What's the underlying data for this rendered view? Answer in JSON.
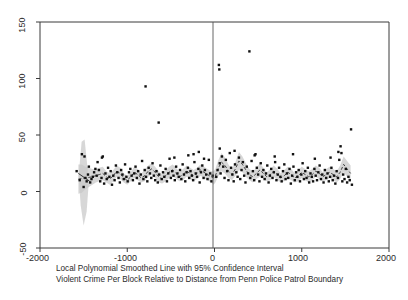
{
  "chart_data": {
    "type": "scatter",
    "title": "",
    "caption_line1": "Local Polynomial Smoothed Line with 95% Confidence Interval",
    "caption_line2": "Violent Crime Per Block Relative to Distance from Penn Police Patrol Boundary",
    "xlabel": "",
    "ylabel": "",
    "xlim": [
      -2000,
      2000
    ],
    "ylim": [
      -50,
      150
    ],
    "xticks": [
      -2000,
      -1000,
      0,
      1000,
      2000
    ],
    "xtick_labels": [
      "-2000",
      "-1000",
      "0",
      "1000",
      "2000"
    ],
    "yticks": [
      -50,
      0,
      50,
      100,
      150
    ],
    "ytick_labels": [
      "-50",
      "0",
      "50",
      "100",
      "150"
    ],
    "grid": false,
    "legend": "none",
    "vline": {
      "x": 0,
      "label": "patrol-boundary",
      "color": "#555555"
    },
    "marker": {
      "shape": "square",
      "size": 2.4,
      "color": "#111111"
    },
    "band": {
      "color": "#c8c8c8",
      "opacity": 0.72,
      "label": "95% Confidence Interval"
    },
    "line": {
      "color": "#333333",
      "width": 0.9,
      "style": "dashed",
      "label": "Local polynomial smoothed line"
    },
    "series": [
      {
        "name": "Violent crime per block",
        "points": [
          [
            -1580,
            18
          ],
          [
            -1545,
            10
          ],
          [
            -1520,
            33
          ],
          [
            -1500,
            4
          ],
          [
            -1480,
            12
          ],
          [
            -1465,
            9
          ],
          [
            -1450,
            15
          ],
          [
            -1440,
            22
          ],
          [
            -1425,
            8
          ],
          [
            -1410,
            11
          ],
          [
            -1395,
            13
          ],
          [
            -1380,
            17
          ],
          [
            -1365,
            20
          ],
          [
            -1350,
            14
          ],
          [
            -1340,
            26
          ],
          [
            -1325,
            19
          ],
          [
            -1310,
            9
          ],
          [
            -1295,
            12
          ],
          [
            -1280,
            31
          ],
          [
            -1265,
            7
          ],
          [
            -1250,
            16
          ],
          [
            -1235,
            11
          ],
          [
            -1220,
            21
          ],
          [
            -1205,
            13
          ],
          [
            -1190,
            18
          ],
          [
            -1175,
            6
          ],
          [
            -1160,
            14
          ],
          [
            -1145,
            10
          ],
          [
            -1130,
            23
          ],
          [
            -1115,
            17
          ],
          [
            -1100,
            12
          ],
          [
            -1085,
            8
          ],
          [
            -1070,
            19
          ],
          [
            -1055,
            15
          ],
          [
            -1040,
            11
          ],
          [
            -1025,
            24
          ],
          [
            -1010,
            13
          ],
          [
            -995,
            9
          ],
          [
            -980,
            17
          ],
          [
            -965,
            20
          ],
          [
            -950,
            14
          ],
          [
            -935,
            10
          ],
          [
            -920,
            16
          ],
          [
            -905,
            22
          ],
          [
            -890,
            12
          ],
          [
            -875,
            18
          ],
          [
            -860,
            7
          ],
          [
            -845,
            15
          ],
          [
            -830,
            27
          ],
          [
            -815,
            11
          ],
          [
            -800,
            19
          ],
          [
            -790,
            93
          ],
          [
            -785,
            13
          ],
          [
            -770,
            9
          ],
          [
            -755,
            21
          ],
          [
            -740,
            16
          ],
          [
            -725,
            12
          ],
          [
            -710,
            25
          ],
          [
            -695,
            14
          ],
          [
            -680,
            10
          ],
          [
            -665,
            18
          ],
          [
            -650,
            8
          ],
          [
            -640,
            61
          ],
          [
            -635,
            15
          ],
          [
            -620,
            23
          ],
          [
            -605,
            11
          ],
          [
            -590,
            17
          ],
          [
            -575,
            13
          ],
          [
            -560,
            20
          ],
          [
            -545,
            9
          ],
          [
            -530,
            16
          ],
          [
            -515,
            29
          ],
          [
            -500,
            12
          ],
          [
            -485,
            18
          ],
          [
            -470,
            14
          ],
          [
            -455,
            10
          ],
          [
            -440,
            22
          ],
          [
            -425,
            16
          ],
          [
            -410,
            13
          ],
          [
            -395,
            19
          ],
          [
            -380,
            11
          ],
          [
            -365,
            24
          ],
          [
            -350,
            15
          ],
          [
            -335,
            9
          ],
          [
            -320,
            17
          ],
          [
            -305,
            21
          ],
          [
            -290,
            12
          ],
          [
            -275,
            18
          ],
          [
            -260,
            14
          ],
          [
            -245,
            10
          ],
          [
            -230,
            26
          ],
          [
            -215,
            16
          ],
          [
            -200,
            13
          ],
          [
            -185,
            20
          ],
          [
            -170,
            8
          ],
          [
            -155,
            17
          ],
          [
            -140,
            23
          ],
          [
            -125,
            12
          ],
          [
            -110,
            19
          ],
          [
            -95,
            15
          ],
          [
            -80,
            11
          ],
          [
            -65,
            28
          ],
          [
            -50,
            16
          ],
          [
            -35,
            9
          ],
          [
            -20,
            14
          ],
          [
            -240,
            33
          ],
          [
            -180,
            35
          ],
          [
            -1490,
            31
          ],
          [
            -1290,
            30
          ],
          [
            -460,
            30
          ],
          [
            -300,
            32
          ],
          [
            -120,
            29
          ],
          [
            20,
            13
          ],
          [
            35,
            19
          ],
          [
            50,
            112
          ],
          [
            55,
            108
          ],
          [
            60,
            25
          ],
          [
            70,
            16
          ],
          [
            85,
            31
          ],
          [
            100,
            22
          ],
          [
            115,
            12
          ],
          [
            130,
            28
          ],
          [
            145,
            18
          ],
          [
            160,
            10
          ],
          [
            175,
            34
          ],
          [
            190,
            21
          ],
          [
            205,
            15
          ],
          [
            220,
            9
          ],
          [
            235,
            24
          ],
          [
            250,
            17
          ],
          [
            265,
            13
          ],
          [
            280,
            30
          ],
          [
            295,
            11
          ],
          [
            310,
            19
          ],
          [
            325,
            26
          ],
          [
            340,
            14
          ],
          [
            355,
            8
          ],
          [
            370,
            22
          ],
          [
            385,
            16
          ],
          [
            400,
            124
          ],
          [
            410,
            12
          ],
          [
            425,
            27
          ],
          [
            440,
            18
          ],
          [
            455,
            10
          ],
          [
            470,
            33
          ],
          [
            485,
            21
          ],
          [
            500,
            15
          ],
          [
            515,
            9
          ],
          [
            530,
            25
          ],
          [
            545,
            13
          ],
          [
            560,
            19
          ],
          [
            575,
            11
          ],
          [
            590,
            16
          ],
          [
            605,
            23
          ],
          [
            620,
            8
          ],
          [
            635,
            14
          ],
          [
            650,
            20
          ],
          [
            665,
            12
          ],
          [
            680,
            17
          ],
          [
            695,
            26
          ],
          [
            710,
            10
          ],
          [
            725,
            15
          ],
          [
            740,
            21
          ],
          [
            755,
            13
          ],
          [
            770,
            9
          ],
          [
            785,
            18
          ],
          [
            800,
            24
          ],
          [
            815,
            11
          ],
          [
            830,
            16
          ],
          [
            845,
            12
          ],
          [
            860,
            20
          ],
          [
            875,
            7
          ],
          [
            890,
            14
          ],
          [
            905,
            22
          ],
          [
            920,
            10
          ],
          [
            935,
            17
          ],
          [
            950,
            13
          ],
          [
            965,
            19
          ],
          [
            980,
            9
          ],
          [
            995,
            15
          ],
          [
            1010,
            25
          ],
          [
            1025,
            11
          ],
          [
            1040,
            18
          ],
          [
            1055,
            12
          ],
          [
            1070,
            21
          ],
          [
            1085,
            8
          ],
          [
            1100,
            16
          ],
          [
            1115,
            13
          ],
          [
            1130,
            9
          ],
          [
            1145,
            20
          ],
          [
            1160,
            14
          ],
          [
            1175,
            10
          ],
          [
            1190,
            17
          ],
          [
            1205,
            23
          ],
          [
            1220,
            11
          ],
          [
            1235,
            15
          ],
          [
            1250,
            8
          ],
          [
            1265,
            19
          ],
          [
            1280,
            12
          ],
          [
            1295,
            16
          ],
          [
            1310,
            9
          ],
          [
            1325,
            13
          ],
          [
            1340,
            21
          ],
          [
            1355,
            10
          ],
          [
            1370,
            14
          ],
          [
            1385,
            7
          ],
          [
            1400,
            18
          ],
          [
            1415,
            12
          ],
          [
            1430,
            28
          ],
          [
            1445,
            40
          ],
          [
            1455,
            34
          ],
          [
            1465,
            9
          ],
          [
            1475,
            15
          ],
          [
            1490,
            11
          ],
          [
            1505,
            20
          ],
          [
            1520,
            8
          ],
          [
            1535,
            13
          ],
          [
            1550,
            10
          ],
          [
            1565,
            55
          ],
          [
            1575,
            6
          ],
          [
            60,
            38
          ],
          [
            230,
            36
          ],
          [
            460,
            32
          ],
          [
            690,
            31
          ],
          [
            900,
            33
          ],
          [
            1150,
            29
          ],
          [
            1330,
            30
          ],
          [
            1420,
            35
          ]
        ]
      }
    ],
    "smooth_line": {
      "x": [
        -1560,
        -1520,
        -1480,
        -1440,
        -1400,
        -1360,
        -1320,
        -1280,
        -1240,
        -1200,
        -1160,
        -1120,
        -1080,
        -1040,
        -1000,
        -960,
        -920,
        -880,
        -840,
        -800,
        -760,
        -720,
        -680,
        -640,
        -600,
        -560,
        -520,
        -480,
        -440,
        -400,
        -360,
        -320,
        -280,
        -240,
        -200,
        -160,
        -120,
        -80,
        -40,
        -10,
        10,
        40,
        80,
        120,
        160,
        200,
        240,
        280,
        320,
        360,
        400,
        440,
        480,
        520,
        560,
        600,
        640,
        680,
        720,
        760,
        800,
        840,
        880,
        920,
        960,
        1000,
        1040,
        1080,
        1120,
        1160,
        1200,
        1240,
        1280,
        1320,
        1360,
        1400,
        1440,
        1480,
        1520,
        1560
      ],
      "y": [
        11,
        11.5,
        12,
        12.5,
        13,
        14,
        15,
        16,
        13,
        11,
        14,
        18,
        16,
        12,
        10,
        13,
        17,
        15,
        12,
        14,
        18,
        20,
        17,
        13,
        11,
        14,
        17,
        19,
        16,
        13,
        15,
        18,
        16,
        14,
        16,
        19,
        17,
        15,
        13,
        12,
        14,
        20,
        26,
        23,
        18,
        15,
        20,
        27,
        24,
        19,
        15,
        13,
        16,
        19,
        16,
        13,
        15,
        18,
        15,
        12,
        14,
        17,
        15,
        12,
        14,
        17,
        15,
        13,
        15,
        18,
        16,
        13,
        15,
        17,
        15,
        13,
        17,
        24,
        20,
        16
      ],
      "lower": [
        -2,
        -1,
        2,
        4,
        6,
        8,
        9,
        10,
        8,
        6,
        9,
        13,
        11,
        8,
        6,
        9,
        12,
        10,
        8,
        9,
        13,
        15,
        12,
        8,
        7,
        9,
        12,
        14,
        11,
        9,
        10,
        13,
        11,
        9,
        11,
        14,
        12,
        10,
        8,
        6,
        8,
        13,
        18,
        16,
        12,
        10,
        14,
        19,
        17,
        13,
        10,
        8,
        11,
        13,
        11,
        9,
        10,
        13,
        10,
        8,
        9,
        12,
        10,
        8,
        9,
        12,
        10,
        8,
        10,
        13,
        11,
        9,
        10,
        12,
        10,
        8,
        11,
        17,
        13,
        9
      ],
      "upper": [
        24,
        24,
        22,
        21,
        20,
        20,
        21,
        22,
        18,
        16,
        19,
        23,
        21,
        16,
        14,
        17,
        22,
        20,
        16,
        19,
        23,
        25,
        22,
        18,
        15,
        19,
        22,
        24,
        21,
        17,
        20,
        23,
        21,
        19,
        21,
        24,
        22,
        20,
        18,
        18,
        20,
        27,
        34,
        30,
        24,
        20,
        26,
        35,
        31,
        25,
        20,
        18,
        21,
        25,
        21,
        17,
        20,
        23,
        20,
        16,
        19,
        22,
        20,
        16,
        19,
        22,
        20,
        18,
        20,
        23,
        21,
        17,
        20,
        22,
        20,
        18,
        23,
        31,
        27,
        23
      ]
    }
  },
  "axis": {
    "y_labels": [
      "150",
      "100",
      "50",
      "0",
      "-50"
    ],
    "x_labels": [
      "-2000",
      "-1000",
      "0",
      "1000",
      "2000"
    ]
  }
}
